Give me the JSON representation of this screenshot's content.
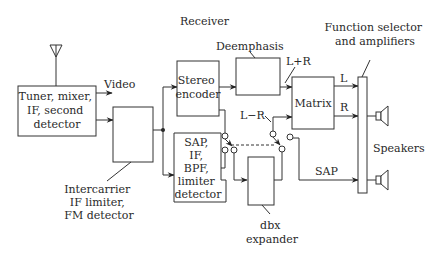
{
  "title": "Receiver",
  "blocks": {
    "tuner": [
      "Tuner, mixer,",
      "IF, second",
      "detector"
    ],
    "intercarrier_label": [
      "Intercarrier",
      "IF limiter,",
      "FM detector"
    ],
    "stereo_encoder": [
      "Stereo",
      "encoder"
    ],
    "sap": [
      "SAP,",
      "IF,",
      "BPF,",
      "limiter",
      "detector"
    ],
    "deemphasis_label": "Deemphasis",
    "matrix": "Matrix",
    "dbx_label": [
      "dbx",
      "expander"
    ],
    "function_selector_label": [
      "Function selector",
      "and amplifiers"
    ],
    "speakers_label": "Speakers"
  },
  "signals": {
    "video": "Video",
    "l_plus_r": "L+R",
    "l_minus_r": "L−R",
    "left": "L",
    "right": "R",
    "sap": "SAP"
  },
  "colors": {
    "line": "#333333",
    "text": "#2a2a2a",
    "background": "#ffffff"
  }
}
